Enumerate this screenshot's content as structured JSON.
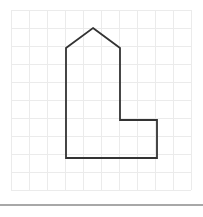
{
  "canvas": {
    "width": 203,
    "height": 217,
    "background_color": "#ffffff"
  },
  "grid": {
    "cell_size": 18,
    "origin_x": 11,
    "origin_y": 10,
    "columns": 10,
    "rows": 10,
    "line_color": "#ebebeb"
  },
  "divider": {
    "y": 204,
    "color": "#a8a8a8",
    "thickness": 2
  },
  "figure": {
    "name": "house-pentomino-outline",
    "stroke_color": "#333333",
    "stroke_width": 1.8,
    "fill": "none",
    "points": "93,28 120,48 120,120 157,120 157,158 66,158 66,48",
    "vertices": [
      {
        "label": "roof-apex",
        "x": 93,
        "y": 28
      },
      {
        "label": "roof-right-eave",
        "x": 120,
        "y": 48
      },
      {
        "label": "body-right-notch-top",
        "x": 120,
        "y": 120
      },
      {
        "label": "foot-right-top",
        "x": 157,
        "y": 120
      },
      {
        "label": "foot-right-bottom",
        "x": 157,
        "y": 158
      },
      {
        "label": "foot-left-bottom",
        "x": 66,
        "y": 158
      },
      {
        "label": "body-left-top",
        "x": 66,
        "y": 48
      }
    ],
    "grid_cells_wide": 5,
    "grid_cells_tall": 7
  }
}
